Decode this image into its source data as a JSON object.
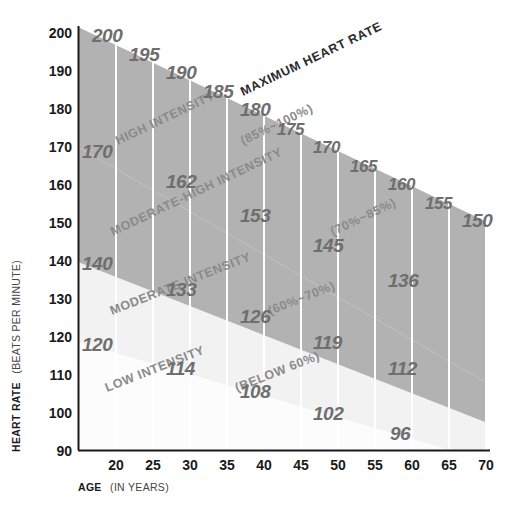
{
  "chart_data": {
    "type": "area",
    "title": "",
    "xlabel": "AGE (IN YEARS)",
    "ylabel": "HEART RATE (BEATS PER MINUTE)",
    "xlabel_bold": "AGE",
    "xlabel_rest": "(IN YEARS)",
    "ylabel_bold": "HEART RATE",
    "ylabel_rest": "(BEATS PER MINUTE)",
    "xlim": [
      15,
      70
    ],
    "ylim": [
      90,
      200
    ],
    "grid": true,
    "legend": "none",
    "x": [
      15,
      20,
      25,
      30,
      35,
      40,
      45,
      50,
      55,
      60,
      65,
      70
    ],
    "xticks": [
      20,
      25,
      30,
      35,
      40,
      45,
      50,
      55,
      60,
      65,
      70
    ],
    "yticks": [
      90,
      100,
      110,
      120,
      130,
      140,
      150,
      160,
      170,
      180,
      190,
      200
    ],
    "series": [
      {
        "name": "MAXIMUM HEART RATE",
        "percent": "100%",
        "values": [
          205,
          200,
          195,
          190,
          185,
          180,
          175,
          170,
          165,
          160,
          155,
          150
        ],
        "labels": [
          "",
          "200",
          "195",
          "190",
          "185",
          "180",
          "175",
          "170",
          "165",
          "160",
          "155",
          "150"
        ]
      },
      {
        "name": "85% of maximum",
        "percent": "85%",
        "values": [
          174,
          170,
          166,
          162,
          157,
          153,
          149,
          145,
          140,
          136,
          132,
          128
        ],
        "labels": [
          "",
          "170",
          "",
          "162",
          "",
          "153",
          "",
          "145",
          "",
          "136",
          "",
          ""
        ]
      },
      {
        "name": "70% of maximum",
        "percent": "70%",
        "values": [
          144,
          140,
          137,
          133,
          130,
          126,
          123,
          119,
          116,
          112,
          109,
          105
        ],
        "labels": [
          "",
          "140",
          "",
          "133",
          "",
          "126",
          "",
          "119",
          "",
          "112",
          "",
          ""
        ]
      },
      {
        "name": "60% of maximum",
        "percent": "60%",
        "values": [
          123,
          120,
          117,
          114,
          111,
          108,
          105,
          102,
          99,
          96,
          93,
          90
        ],
        "labels": [
          "",
          "120",
          "",
          "114",
          "",
          "108",
          "",
          "102",
          "",
          "96",
          "",
          ""
        ]
      }
    ],
    "zones": [
      {
        "label": "MAXIMUM HEART RATE",
        "range": "",
        "band": "top-line"
      },
      {
        "label": "HIGH INTENSITY",
        "range": "(85%~100%)",
        "band": "high"
      },
      {
        "label": "MODERATE-HIGH INTENSITY",
        "range": "(70%~85%)",
        "band": "moderate-high"
      },
      {
        "label": "MODERATE INTENSITY",
        "range": "(60%~70%)",
        "band": "moderate"
      },
      {
        "label": "LOW INTENSITY",
        "range": "(BELOW 60%)",
        "band": "low"
      }
    ],
    "colors": {
      "high_band": "#b2b2b2",
      "moderate_high_band": "#b2b2b2",
      "moderate_band": "#efefef",
      "low_band": "#ffffff",
      "gridline": "#ffffff",
      "axis": "#1a1a1a",
      "value_text": "#6e6e6e",
      "zone_text": "#8a8a8a",
      "background": "#ffffff"
    },
    "value_labels": [
      {
        "age": 20,
        "value": "200",
        "x": 92,
        "y": 42,
        "size": "big"
      },
      {
        "age": 25,
        "value": "195",
        "x": 129,
        "y": 61,
        "size": "big"
      },
      {
        "age": 30,
        "value": "190",
        "x": 166,
        "y": 79,
        "size": "big"
      },
      {
        "age": 35,
        "value": "185",
        "x": 203,
        "y": 98,
        "size": "big"
      },
      {
        "age": 40,
        "value": "180",
        "x": 240,
        "y": 116,
        "size": "big"
      },
      {
        "age": 45,
        "value": "175",
        "x": 277,
        "y": 135,
        "size": "small"
      },
      {
        "age": 50,
        "value": "170",
        "x": 313,
        "y": 153,
        "size": "small"
      },
      {
        "age": 55,
        "value": "165",
        "x": 350,
        "y": 172,
        "size": "small"
      },
      {
        "age": 60,
        "value": "160",
        "x": 388,
        "y": 190,
        "size": "small"
      },
      {
        "age": 65,
        "value": "155",
        "x": 425,
        "y": 209,
        "size": "small"
      },
      {
        "age": 70,
        "value": "150",
        "x": 462,
        "y": 227,
        "size": "big"
      },
      {
        "age": 15,
        "value": "170",
        "x": 82,
        "y": 158,
        "size": "big"
      },
      {
        "age": 30,
        "value": "162",
        "x": 166,
        "y": 188,
        "size": "big"
      },
      {
        "age": 40,
        "value": "153",
        "x": 240,
        "y": 222,
        "size": "big"
      },
      {
        "age": 50,
        "value": "145",
        "x": 313,
        "y": 252,
        "size": "big"
      },
      {
        "age": 60,
        "value": "136",
        "x": 388,
        "y": 287,
        "size": "big"
      },
      {
        "age": 15,
        "value": "140",
        "x": 82,
        "y": 270,
        "size": "big"
      },
      {
        "age": 30,
        "value": "133",
        "x": 166,
        "y": 296,
        "size": "big"
      },
      {
        "age": 40,
        "value": "126",
        "x": 240,
        "y": 323,
        "size": "big"
      },
      {
        "age": 50,
        "value": "119",
        "x": 313,
        "y": 349,
        "size": "big"
      },
      {
        "age": 60,
        "value": "112",
        "x": 388,
        "y": 375,
        "size": "big"
      },
      {
        "age": 15,
        "value": "120",
        "x": 82,
        "y": 351,
        "size": "big"
      },
      {
        "age": 30,
        "value": "114",
        "x": 166,
        "y": 375,
        "size": "big"
      },
      {
        "age": 40,
        "value": "108",
        "x": 240,
        "y": 398,
        "size": "big"
      },
      {
        "age": 50,
        "value": "102",
        "x": 313,
        "y": 420,
        "size": "big"
      },
      {
        "age": 60,
        "value": "96",
        "x": 390,
        "y": 440,
        "size": "big"
      }
    ]
  },
  "axis": {
    "y_ticks": [
      "200",
      "190",
      "180",
      "170",
      "160",
      "150",
      "140",
      "130",
      "120",
      "110",
      "100",
      "90"
    ],
    "x_ticks": [
      "20",
      "25",
      "30",
      "35",
      "40",
      "45",
      "50",
      "55",
      "60",
      "65",
      "70"
    ]
  }
}
